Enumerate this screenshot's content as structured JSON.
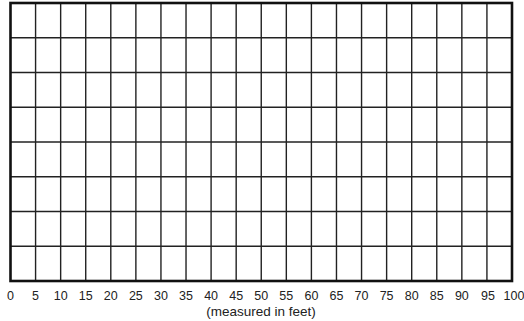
{
  "chart_data": {
    "type": "table",
    "title": "",
    "xlabel": "(measured in feet)",
    "ylabel": "",
    "x_ticks": [
      "0",
      "5",
      "10",
      "15",
      "20",
      "25",
      "30",
      "35",
      "40",
      "45",
      "50",
      "55",
      "60",
      "65",
      "70",
      "75",
      "80",
      "85",
      "90",
      "95",
      "100"
    ],
    "xlim": [
      0,
      100
    ],
    "x_step": 5,
    "columns": 20,
    "rows": 8,
    "grid": true,
    "legend": null,
    "values": []
  },
  "colors": {
    "grid_line": "#222222",
    "border": "#111111",
    "background": "#ffffff"
  },
  "layout": {
    "grid_left": 10.5,
    "grid_right": 512,
    "grid_top": 3,
    "grid_bottom": 281
  }
}
